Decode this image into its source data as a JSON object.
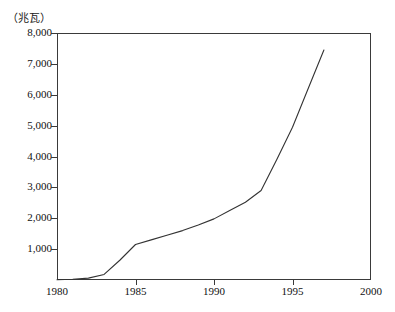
{
  "chart_data": {
    "type": "line",
    "title": "（1980—1997年）",
    "ylabel": "（兆瓦）",
    "xlabel": "",
    "unit": "兆瓦",
    "grid": false,
    "legend": false,
    "xlim": [
      1980,
      2000
    ],
    "ylim": [
      0,
      8000
    ],
    "y_ticks": [
      1000,
      2000,
      3000,
      4000,
      5000,
      6000,
      7000,
      8000
    ],
    "y_tick_labels": [
      "1,000",
      "2,000",
      "3,000",
      "4,000",
      "5,000",
      "6,000",
      "7,000",
      "8,000"
    ],
    "x_ticks": [
      1980,
      1985,
      1990,
      1995,
      2000
    ],
    "x_tick_labels": [
      "1980",
      "1985",
      "1990",
      "1995",
      "2000"
    ],
    "series": [
      {
        "name": "装机容量",
        "color": "#333333",
        "x": [
          1980,
          1981,
          1982,
          1983,
          1984,
          1985,
          1986,
          1987,
          1988,
          1989,
          1990,
          1991,
          1992,
          1993,
          1994,
          1995,
          1996,
          1997
        ],
        "values": [
          10,
          25,
          60,
          180,
          640,
          1150,
          1300,
          1450,
          1600,
          1780,
          1980,
          2250,
          2520,
          2900,
          3900,
          4950,
          6200,
          7450
        ]
      }
    ]
  }
}
